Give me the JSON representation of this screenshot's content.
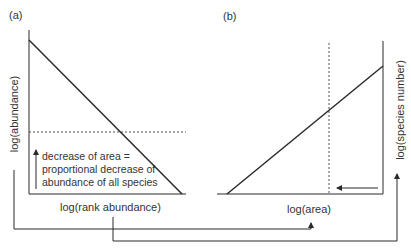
{
  "panels": {
    "a": {
      "label": "(a)",
      "x_axis_label": "log(rank abundance)",
      "y_axis_label": "log(abundance)",
      "annotation": [
        "decrease of area =",
        "proportional decrease of",
        "abundance of all species"
      ]
    },
    "b": {
      "label": "(b)",
      "x_axis_label": "log(area)",
      "y_axis_label": "log(species number)"
    }
  },
  "connectors": [
    {
      "from": "log(abundance)",
      "to": "log(area)"
    },
    {
      "from": "log(rank abundance)",
      "to": "log(species number)"
    }
  ],
  "colors": {
    "line": "#2a2a2a",
    "text": "#333333",
    "background": "#ffffff"
  }
}
